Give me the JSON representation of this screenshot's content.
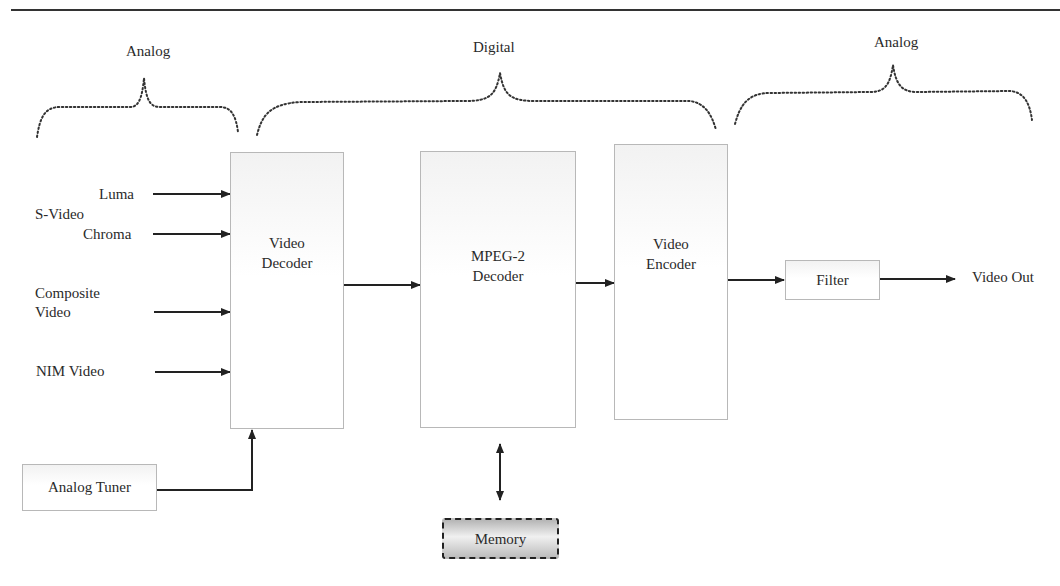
{
  "regions": [
    {
      "label": "Analog"
    },
    {
      "label": "Digital"
    },
    {
      "label": "Analog"
    }
  ],
  "inputs": {
    "group_label": "S-Video",
    "luma": "Luma",
    "chroma": "Chroma",
    "composite_line1": "Composite",
    "composite_line2": "Video",
    "nim": "NIM Video"
  },
  "blocks": {
    "video_decoder": {
      "line1": "Video",
      "line2": "Decoder"
    },
    "mpeg2_decoder": {
      "line1": "MPEG-2",
      "line2": "Decoder"
    },
    "video_encoder": {
      "line1": "Video",
      "line2": "Encoder"
    },
    "filter": "Filter",
    "analog_tuner": "Analog Tuner",
    "memory": "Memory"
  },
  "output": {
    "label": "Video Out"
  }
}
